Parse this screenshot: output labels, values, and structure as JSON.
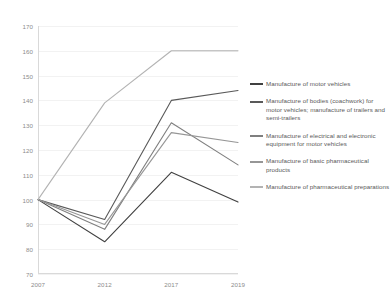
{
  "chart_data": {
    "type": "line",
    "title": "",
    "subtitle": "",
    "xlabel": "",
    "ylabel": "",
    "categories": [
      "2007",
      "2012",
      "2017",
      "2019"
    ],
    "x_tick_labels": [
      "2007",
      "2012",
      "2017",
      "2019"
    ],
    "y_tick_labels": [
      "70",
      "80",
      "90",
      "100",
      "110",
      "120",
      "130",
      "140",
      "150",
      "160",
      "170"
    ],
    "ylim": [
      70,
      170
    ],
    "y_tick_step": 10,
    "grid": true,
    "legend_position": "right",
    "series": [
      {
        "name": "Manufacture of motor vehicles",
        "color": "#404040",
        "values": [
          100,
          83,
          111,
          99
        ]
      },
      {
        "name": "Manufacture of bodies (coachwork) for motor vehicles; manufacture of trailers and semi-trailers",
        "color": "#595959",
        "values": [
          100,
          92,
          140,
          144
        ]
      },
      {
        "name": "Manufacture of electrical and electronic equipment for motor vehicles",
        "color": "#7f7f7f",
        "values": [
          100,
          88,
          131,
          114
        ]
      },
      {
        "name": "Manufacture of basic pharmaceutical products",
        "color": "#969696",
        "values": [
          100,
          90,
          127,
          123
        ]
      },
      {
        "name": "Manufacture of pharmaceutical preparations",
        "color": "#b3b3b3",
        "values": [
          100,
          139,
          160,
          160
        ]
      }
    ]
  },
  "legend": {
    "items": [
      {
        "label": "Manufacture of motor vehicles",
        "color": "#404040"
      },
      {
        "label": "Manufacture of bodies (coachwork) for motor vehicles; manufacture of trailers and semi-trailers",
        "color": "#595959"
      },
      {
        "label": "Manufacture of electrical and electronic equipment for motor vehicles",
        "color": "#7f7f7f"
      },
      {
        "label": "Manufacture of basic pharmaceutical products",
        "color": "#969696"
      },
      {
        "label": "Manufacture of pharmaceutical preparations",
        "color": "#b3b3b3"
      }
    ]
  }
}
